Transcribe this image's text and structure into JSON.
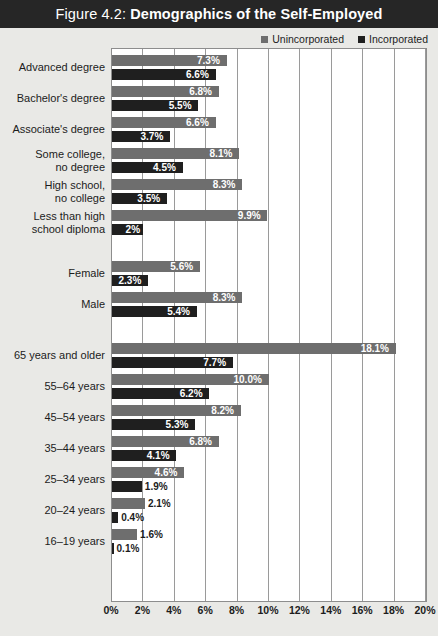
{
  "figure": {
    "title_prefix": "Figure 4.2: ",
    "title_main": "Demographics of the Self-Employed"
  },
  "legend": {
    "position": "top-right",
    "items": [
      {
        "label": "Unincorporated",
        "color": "#6e6e6e",
        "swatch": "square-swatch-icon"
      },
      {
        "label": "Incorporated",
        "color": "#1f1f1f",
        "swatch": "square-swatch-icon"
      }
    ]
  },
  "axis": {
    "ticks": [
      "0%",
      "2%",
      "4%",
      "6%",
      "8%",
      "10%",
      "12%",
      "14%",
      "16%",
      "18%",
      "20%"
    ],
    "min": 0,
    "max": 20
  },
  "chart_data": {
    "type": "bar",
    "orientation": "horizontal",
    "title": "Figure 4.2: Demographics of the Self-Employed",
    "xlabel": "",
    "ylabel": "",
    "xlim": [
      0,
      20
    ],
    "grid": true,
    "legend_position": "top-right",
    "categories": [
      "Advanced degree",
      "Bachelor's degree",
      "Associate's degree",
      "Some college,\nno degree",
      "High school,\nno college",
      "Less than high\nschool diploma",
      "Female",
      "Male",
      "65 years and older",
      "55–64 years",
      "45–54 years",
      "35–44 years",
      "25–34 years",
      "20–24 years",
      "16–19 years"
    ],
    "groups": [
      {
        "name": "Education",
        "categories": [
          "Advanced degree",
          "Bachelor's degree",
          "Associate's degree",
          "Some college,\nno degree",
          "High school,\nno college",
          "Less than high\nschool diploma"
        ]
      },
      {
        "name": "Sex",
        "categories": [
          "Female",
          "Male"
        ]
      },
      {
        "name": "Age",
        "categories": [
          "65 years and older",
          "55–64 years",
          "45–54 years",
          "35–44 years",
          "25–34 years",
          "20–24 years",
          "16–19 years"
        ]
      }
    ],
    "series": [
      {
        "name": "Unincorporated",
        "color": "#6e6e6e",
        "values": [
          7.3,
          6.8,
          6.6,
          8.1,
          8.3,
          9.9,
          5.6,
          8.3,
          18.1,
          10.0,
          8.2,
          6.8,
          4.6,
          2.1,
          1.6
        ],
        "labels": [
          "7.3%",
          "6.8%",
          "6.6%",
          "8.1%",
          "8.3%",
          "9.9%",
          "5.6%",
          "8.3%",
          "18.1%",
          "10.0%",
          "8.2%",
          "6.8%",
          "4.6%",
          "2.1%",
          "1.6%"
        ]
      },
      {
        "name": "Incorporated",
        "color": "#1f1f1f",
        "values": [
          6.6,
          5.5,
          3.7,
          4.5,
          3.5,
          2.0,
          2.3,
          5.4,
          7.7,
          6.2,
          5.3,
          4.1,
          1.9,
          0.4,
          0.1
        ],
        "labels": [
          "6.6%",
          "5.5%",
          "3.7%",
          "4.5%",
          "3.5%",
          "2%",
          "2.3%",
          "5.4%",
          "7.7%",
          "6.2%",
          "5.3%",
          "4.1%",
          "1.9%",
          "0.4%",
          "0.1%"
        ]
      }
    ]
  }
}
